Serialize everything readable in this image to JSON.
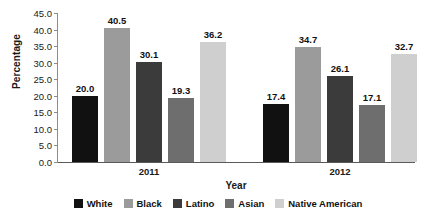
{
  "chart_data": {
    "type": "bar",
    "title": "",
    "xlabel": "Year",
    "ylabel": "Percentage",
    "categories": [
      "2011",
      "2012"
    ],
    "series": [
      {
        "name": "White",
        "values": [
          20.0,
          17.4
        ],
        "color": "#111111"
      },
      {
        "name": "Black",
        "values": [
          40.5,
          34.7
        ],
        "color": "#9b9b9b"
      },
      {
        "name": "Latino",
        "values": [
          30.1,
          26.1
        ],
        "color": "#3b3b3b"
      },
      {
        "name": "Asian",
        "values": [
          19.3,
          17.1
        ],
        "color": "#6e6e6e"
      },
      {
        "name": "Native American",
        "values": [
          36.2,
          32.7
        ],
        "color": "#cfcfcf"
      }
    ],
    "ylim": [
      0.0,
      45.0
    ],
    "ytick_labels": [
      "45.0",
      "40.0",
      "35.0",
      "30.0",
      "25.0",
      "20.0",
      "15.0",
      "10.0",
      "5.0",
      "0.0"
    ],
    "ytick_values": [
      45.0,
      40.0,
      35.0,
      30.0,
      25.0,
      20.0,
      15.0,
      10.0,
      5.0,
      0.0
    ],
    "grid": false,
    "legend_position": "bottom",
    "value_labels": true
  }
}
